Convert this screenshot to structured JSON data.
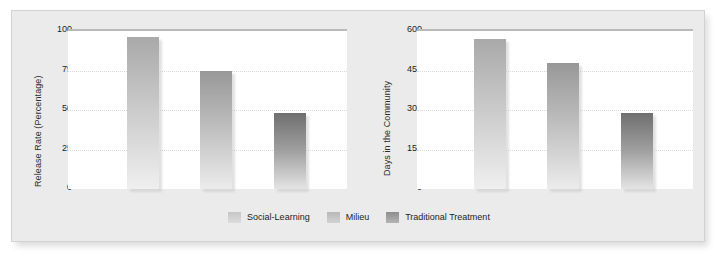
{
  "figure": {
    "background": "#ebebeb",
    "panel_border": "#d2d2d2",
    "series_colors": [
      "#c6c6c6",
      "#b8b8b8",
      "#8e8e8e"
    ]
  },
  "legend": {
    "position": "bottom-center",
    "items": [
      {
        "label": "Social-Learning",
        "color": "#c6c6c6"
      },
      {
        "label": "Milieu",
        "color": "#b8b8b8"
      },
      {
        "label": "Traditional Treatment",
        "color": "#8e8e8e"
      }
    ]
  },
  "chart_data": [
    {
      "type": "bar",
      "title": "",
      "xlabel": "",
      "ylabel": "Release Rate (Percentage)",
      "categories": [
        "Social-Learning",
        "Milieu",
        "Traditional Treatment"
      ],
      "values": [
        96,
        75,
        48
      ],
      "ylim": [
        0,
        100
      ],
      "yticks": [
        0,
        25,
        50,
        75,
        100
      ],
      "ytick_labels": [
        "0",
        "25",
        "50",
        "75",
        "100"
      ],
      "grid": true
    },
    {
      "type": "bar",
      "title": "",
      "xlabel": "",
      "ylabel": "Days in the Community",
      "categories": [
        "Social-Learning",
        "Milieu",
        "Traditional Treatment"
      ],
      "values": [
        570,
        480,
        290
      ],
      "ylim": [
        0,
        600
      ],
      "yticks": [
        0,
        150,
        300,
        450,
        600
      ],
      "ytick_labels": [
        "0",
        "150",
        "300",
        "450",
        "600"
      ],
      "grid": true
    }
  ]
}
